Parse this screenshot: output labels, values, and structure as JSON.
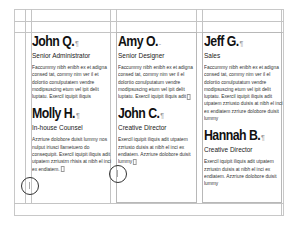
{
  "document": {
    "view": "layout-page-with-guides",
    "columns": [
      {
        "entries": [
          {
            "name": "John Q.",
            "title": "Senior Administrator",
            "body": "Faccummy nibh enibh ex et adigna consed tat, commy nim ver il et dolortio conulputatem vendre modipsuscing etum vel ipit delit luptatu. Exercil iquipit iliquis"
          },
          {
            "name": "Molly H.",
            "title": "In-house Counsel",
            "body": "Azzriure dolobore duisit lummy nos nulput iriusci llametuero do consequipit. Exercil iquipit iliquis adit utpatem zzriustrn rhisis at nibh el inci ex endiatem."
          }
        ]
      },
      {
        "entries": [
          {
            "name": "Amy O.",
            "title": "Senior Designer",
            "body": "Faccummy nibh enibh ex et adigna consed tat, commy nim ver il el dolortio conulputatum vendre modipsuscing etum vel ipit delit luptatu. Exercil iquipit iliquis adit"
          },
          {
            "name": "John C.",
            "title": "Creative Director",
            "body": "Exercil iquipit iliquis adit utpatem zzriusto duisis at nibh el inci ex endiatem. Azzriure dolobore duisit lummy"
          }
        ]
      },
      {
        "entries": [
          {
            "name": "Jeff G.",
            "title": "Sales",
            "body": "Faccummy nibh enibh ex et adigna consed tat, commy nim ver il el dolortio conulputatum vendre modipsuscing etum vel ipit delit luptatu. Exercil iquipit iliquis adit utpatem zzriusto duisis at nibh el inci ex endiatem zzriure dolobore duisit lummy"
          },
          {
            "name": "Hannah B.",
            "title": "Creative Director",
            "body": "Exercil iquipit iliquis adit utpatem zzriustn duisis at nibh el inci ex endiatem. Azzriure dolobore duisit lummy"
          }
        ]
      }
    ],
    "pilcrow": "¶",
    "icons": [
      "pilcrow-icon",
      "overset-text-icon",
      "circle-marker-icon"
    ]
  }
}
